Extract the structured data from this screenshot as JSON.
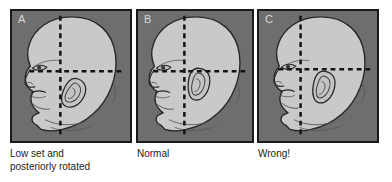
{
  "figure": {
    "background_color": "#ffffff",
    "panel_background_color": "#6e6e6e",
    "panel_border_color": "#1a1a1a",
    "skin_fill_color": "#c9c9c9",
    "outline_color": "#262626",
    "dashed_line_color": "#141414",
    "letter_color": "#d8d8d8",
    "caption_color": "#1c1c1c"
  },
  "panels": [
    {
      "id": "a",
      "letter": "A",
      "caption": "Low set and\nposteriorly rotated",
      "ear_state": "low-set-posteriorly-rotated",
      "reference_lines": [
        "vertical-dashed",
        "horizontal-dashed"
      ]
    },
    {
      "id": "b",
      "letter": "B",
      "caption": "Normal",
      "ear_state": "normal",
      "reference_lines": [
        "vertical-dashed",
        "horizontal-dashed"
      ]
    },
    {
      "id": "c",
      "letter": "C",
      "caption": "Wrong!",
      "ear_state": "incorrect-measurement",
      "reference_lines": [
        "vertical-dashed",
        "horizontal-dashed"
      ]
    }
  ]
}
